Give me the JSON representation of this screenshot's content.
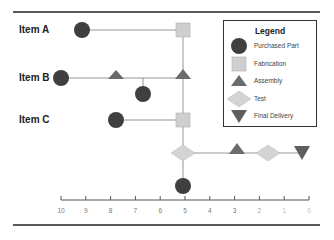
{
  "rows": [
    {
      "label": "Item A"
    },
    {
      "label": "Item B"
    },
    {
      "label": "Item C"
    }
  ],
  "legend": {
    "title": "Legend",
    "items": [
      {
        "shape": "circle",
        "label": "Purchased Part"
      },
      {
        "shape": "square",
        "label": "Fabrication"
      },
      {
        "shape": "triangle",
        "label": "Assembly"
      },
      {
        "shape": "diamond",
        "label": "Test"
      },
      {
        "shape": "inverted-triangle",
        "label": "Final Delivery"
      }
    ]
  },
  "axis": {
    "ticks": [
      "10",
      "9",
      "8",
      "7",
      "6",
      "5",
      "4",
      "3",
      "2",
      "1",
      "0"
    ]
  },
  "colors": {
    "purchased_part": "#3f3f3f",
    "fabrication": "#cfcfcf",
    "assembly": "#6b6b6b",
    "test": "#d4d4d4",
    "final_delivery": "#5e5e5e",
    "line": "#8a8a8a",
    "rule": "#222222"
  }
}
